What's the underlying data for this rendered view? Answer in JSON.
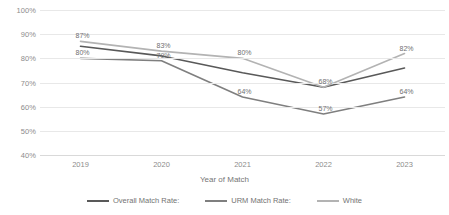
{
  "chart_data": {
    "type": "line",
    "title": "",
    "xlabel": "Year of Match",
    "ylabel": "",
    "categories": [
      "2019",
      "2020",
      "2021",
      "2022",
      "2023"
    ],
    "ylim": [
      40,
      100
    ],
    "ytick_labels": [
      "100%",
      "90%",
      "80%",
      "70%",
      "60%",
      "50%",
      "40%"
    ],
    "ytick_values": [
      100,
      90,
      80,
      70,
      60,
      50,
      40
    ],
    "grid": true,
    "legend_position": "bottom",
    "series": [
      {
        "name": "Overall Match Rate:",
        "color": "#595959",
        "values": [
          85,
          81,
          74,
          68,
          76
        ],
        "point_labels": [
          "",
          "",
          "",
          "",
          ""
        ]
      },
      {
        "name": "URM Match Rate:",
        "color": "#7f7f7f",
        "values": [
          80,
          79,
          64,
          57,
          64
        ],
        "point_labels": [
          "80%",
          "79%",
          "64%",
          "57%",
          "64%"
        ]
      },
      {
        "name": "White",
        "color": "#b3b3b3",
        "values": [
          87,
          83,
          80,
          68,
          82
        ],
        "point_labels": [
          "87%",
          "83%",
          "80%",
          "68%",
          "82%"
        ]
      }
    ]
  }
}
